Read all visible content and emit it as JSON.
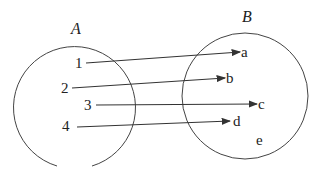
{
  "diagram": {
    "type": "mapping",
    "sets": [
      {
        "name": "A",
        "elements": [
          "1",
          "2",
          "3",
          "4"
        ]
      },
      {
        "name": "B",
        "elements": [
          "a",
          "b",
          "c",
          "d",
          "e"
        ]
      }
    ],
    "mapping": [
      {
        "from": "1",
        "to": "a"
      },
      {
        "from": "2",
        "to": "b"
      },
      {
        "from": "3",
        "to": "c"
      },
      {
        "from": "4",
        "to": "d"
      }
    ],
    "colors": {
      "stroke": "#333333",
      "text": "#222222"
    }
  }
}
